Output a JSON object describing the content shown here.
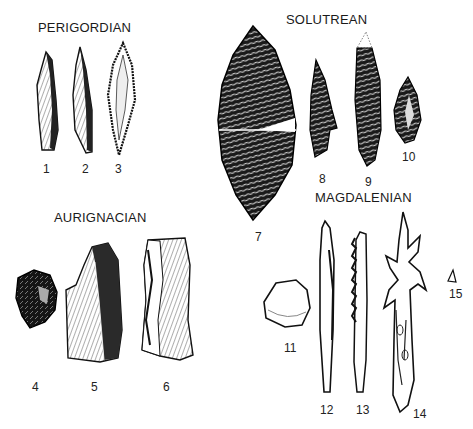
{
  "groups": {
    "perigordian": "PERIGORDIAN",
    "solutrean": "SOLUTREAN",
    "aurignacian": "AURIGNACIAN",
    "magdalenian": "MAGDALENIAN"
  },
  "items": {
    "n1": "1",
    "n2": "2",
    "n3": "3",
    "n4": "4",
    "n5": "5",
    "n6": "6",
    "n7": "7",
    "n8": "8",
    "n9": "9",
    "n10": "10",
    "n11": "11",
    "n12": "12",
    "n13": "13",
    "n14": "14",
    "n15": "15"
  },
  "colors": {
    "ink": "#1a1a1a",
    "paper": "#ffffff"
  }
}
